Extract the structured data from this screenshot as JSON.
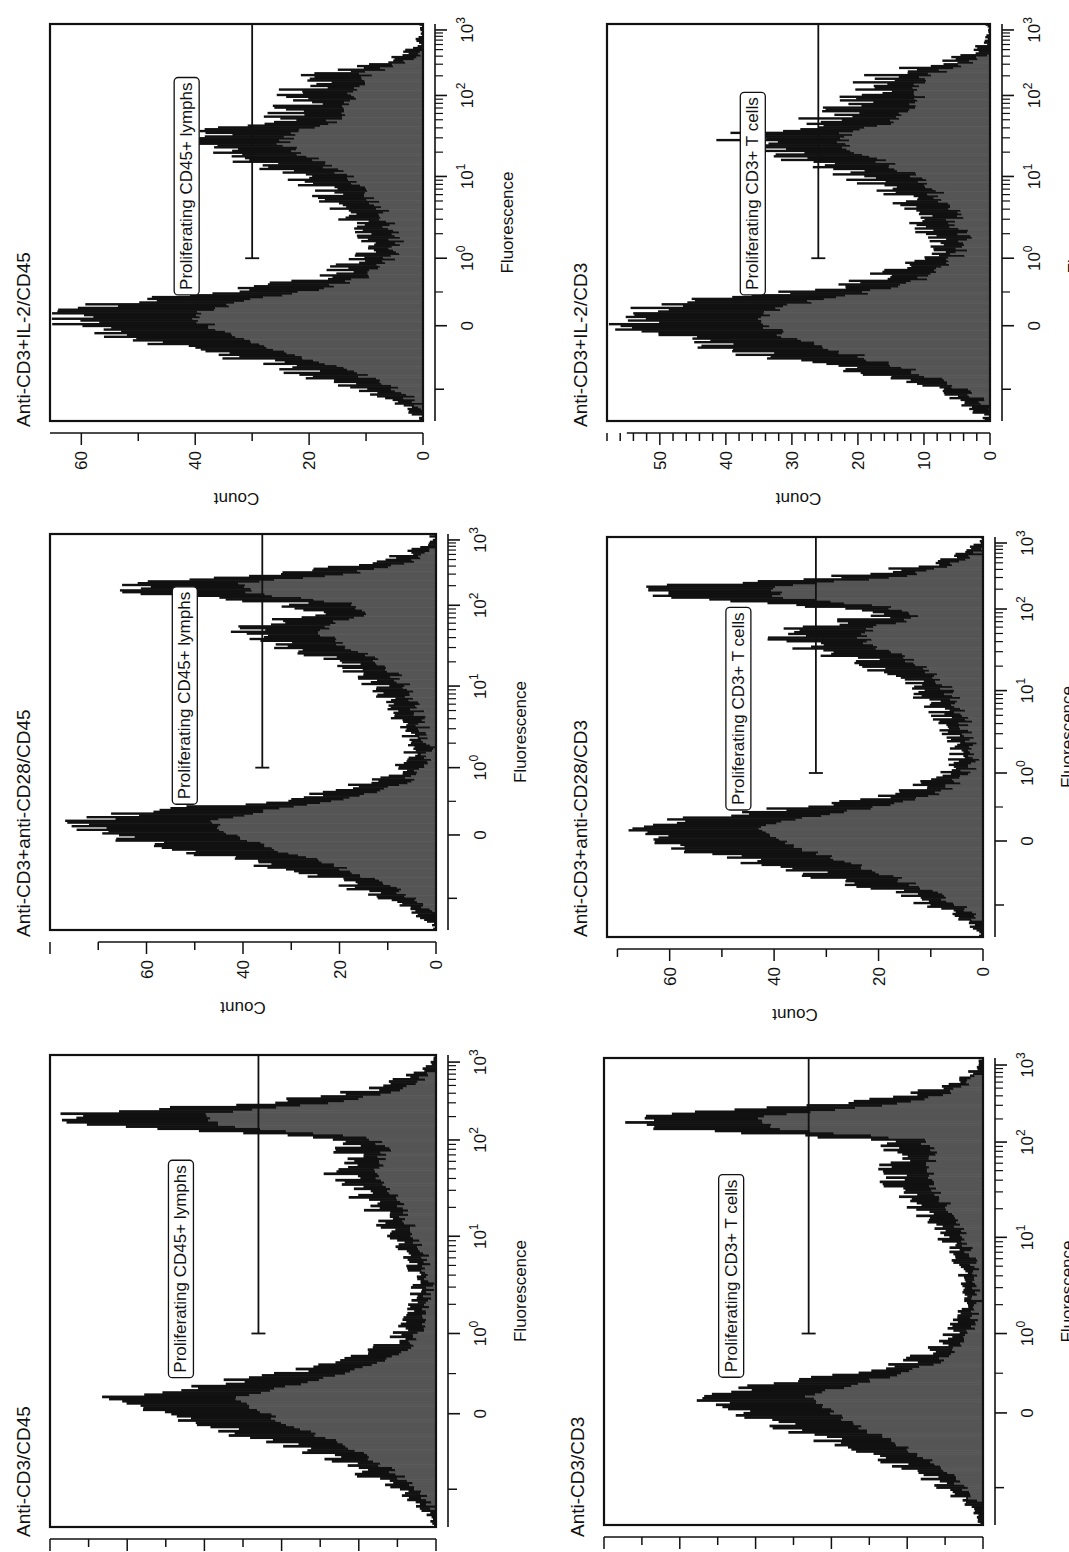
{
  "figure": {
    "orientation": "rotated 90 degrees counter-clockwise",
    "fill_color": "#555555",
    "outline_color": "#111111"
  },
  "chart_data": [
    {
      "id": "p1",
      "type": "bar",
      "title": "Anti-CD3/CD45",
      "xlabel": "Fluorescence",
      "ylabel": "Count",
      "xscale": "biexponential",
      "xticks": [
        "0",
        "10^0",
        "10^1",
        "10^2",
        "10^3"
      ],
      "yticks": [
        "0",
        "20",
        "40",
        "60",
        "80",
        "100"
      ],
      "ylim": [
        0,
        100
      ],
      "gate": {
        "label": "Proliferating CD45+ lymphs",
        "from": "10^0",
        "to": "10^3",
        "count_level": 46
      },
      "profile_x": [
        0,
        0.025,
        0.05,
        0.075,
        0.1,
        0.125,
        0.15,
        0.175,
        0.2,
        0.225,
        0.25,
        0.275,
        0.3,
        0.325,
        0.35,
        0.375,
        0.4,
        0.425,
        0.45,
        0.475,
        0.5,
        0.525,
        0.55,
        0.575,
        0.6,
        0.625,
        0.65,
        0.675,
        0.7,
        0.725,
        0.75,
        0.775,
        0.8,
        0.825,
        0.85,
        0.875,
        0.9,
        0.925,
        0.95,
        0.975,
        1
      ],
      "values": [
        0,
        2,
        5,
        9,
        15,
        22,
        30,
        40,
        52,
        64,
        75,
        82,
        60,
        38,
        24,
        15,
        10,
        8,
        7,
        6,
        5,
        5,
        6,
        7,
        9,
        11,
        14,
        16,
        19,
        23,
        25,
        24,
        22,
        28,
        90,
        95,
        40,
        18,
        8,
        2,
        0
      ]
    },
    {
      "id": "p2",
      "type": "bar",
      "title": "Anti-CD3+anti-CD28/CD45",
      "xlabel": "Fluorescence",
      "ylabel": "Count",
      "xscale": "biexponential",
      "xticks": [
        "0",
        "10^0",
        "10^1",
        "10^2",
        "10^3"
      ],
      "yticks": [
        "0",
        "20",
        "40",
        "60"
      ],
      "ylim": [
        0,
        80
      ],
      "gate": {
        "label": "Proliferating CD45+ lymphs",
        "from": "10^0",
        "to": "10^3",
        "count_level": 36
      },
      "profile_x": [
        0,
        0.025,
        0.05,
        0.075,
        0.1,
        0.125,
        0.15,
        0.175,
        0.2,
        0.225,
        0.25,
        0.275,
        0.3,
        0.325,
        0.35,
        0.375,
        0.4,
        0.425,
        0.45,
        0.475,
        0.5,
        0.525,
        0.55,
        0.575,
        0.6,
        0.625,
        0.65,
        0.675,
        0.7,
        0.725,
        0.75,
        0.775,
        0.8,
        0.825,
        0.85,
        0.875,
        0.9,
        0.925,
        0.95,
        0.975,
        1
      ],
      "values": [
        0,
        2,
        5,
        9,
        15,
        22,
        30,
        40,
        52,
        62,
        70,
        74,
        58,
        35,
        20,
        12,
        8,
        6,
        5,
        5,
        6,
        7,
        8,
        9,
        11,
        13,
        16,
        20,
        26,
        34,
        38,
        36,
        22,
        30,
        62,
        65,
        30,
        12,
        6,
        2,
        0
      ]
    },
    {
      "id": "p3",
      "type": "bar",
      "title": "Anti-CD3+IL-2/CD45",
      "xlabel": "Fluorescence",
      "ylabel": "Count",
      "xscale": "biexponential",
      "xticks": [
        "0",
        "10^0",
        "10^1",
        "10^2",
        "10^3"
      ],
      "yticks": [
        "0",
        "20",
        "40",
        "60"
      ],
      "ylim": [
        0,
        65.5
      ],
      "gate": {
        "label": "Proliferating CD45+ lymphs",
        "from": "10^0",
        "to": "10^3",
        "count_level": 30
      },
      "profile_x": [
        0,
        0.025,
        0.05,
        0.075,
        0.1,
        0.125,
        0.15,
        0.175,
        0.2,
        0.225,
        0.25,
        0.275,
        0.3,
        0.325,
        0.35,
        0.375,
        0.4,
        0.425,
        0.45,
        0.475,
        0.5,
        0.525,
        0.55,
        0.575,
        0.6,
        0.625,
        0.65,
        0.675,
        0.7,
        0.725,
        0.75,
        0.775,
        0.8,
        0.825,
        0.85,
        0.875,
        0.9,
        0.925,
        0.95,
        0.975,
        1
      ],
      "values": [
        0,
        2,
        5,
        9,
        15,
        22,
        30,
        40,
        50,
        57,
        62,
        63,
        52,
        35,
        22,
        15,
        12,
        10,
        9,
        10,
        12,
        13,
        15,
        18,
        21,
        24,
        30,
        36,
        40,
        38,
        28,
        24,
        22,
        22,
        20,
        18,
        8,
        3,
        1,
        0,
        0
      ]
    },
    {
      "id": "p4",
      "type": "bar",
      "title": "Anti-CD3/CD3",
      "xlabel": "Fluorescence",
      "ylabel": "Count",
      "xscale": "biexponential",
      "xticks": [
        "0",
        "10^0",
        "10^1",
        "10^2",
        "10^3"
      ],
      "yticks": [
        "0",
        "20",
        "40",
        "60",
        "80",
        "100"
      ],
      "ylim": [
        0,
        100
      ],
      "gate": {
        "label": "Proliferating CD3+ T cells",
        "from": "10^0",
        "to": "10^3",
        "count_level": 46
      },
      "profile_x": [
        0,
        0.025,
        0.05,
        0.075,
        0.1,
        0.125,
        0.15,
        0.175,
        0.2,
        0.225,
        0.25,
        0.275,
        0.3,
        0.325,
        0.35,
        0.375,
        0.4,
        0.425,
        0.45,
        0.475,
        0.5,
        0.525,
        0.55,
        0.575,
        0.6,
        0.625,
        0.65,
        0.675,
        0.7,
        0.725,
        0.75,
        0.775,
        0.8,
        0.825,
        0.85,
        0.875,
        0.9,
        0.925,
        0.95,
        0.975,
        1
      ],
      "values": [
        0,
        2,
        5,
        9,
        14,
        20,
        28,
        38,
        48,
        58,
        66,
        74,
        56,
        34,
        20,
        13,
        9,
        7,
        6,
        5,
        5,
        5,
        6,
        7,
        9,
        11,
        13,
        16,
        19,
        22,
        24,
        23,
        22,
        28,
        88,
        93,
        38,
        16,
        7,
        2,
        0
      ]
    },
    {
      "id": "p5",
      "type": "bar",
      "title": "Anti-CD3+anti-CD28/CD3",
      "xlabel": "Fluorescence",
      "ylabel": "Count",
      "xscale": "biexponential",
      "xticks": [
        "0",
        "10^0",
        "10^1",
        "10^2",
        "10^3"
      ],
      "yticks": [
        "0",
        "20",
        "40",
        "60"
      ],
      "ylim": [
        0,
        72
      ],
      "gate": {
        "label": "Proliferating CD3+ T cells",
        "from": "10^0",
        "to": "10^3",
        "count_level": 32
      },
      "profile_x": [
        0,
        0.025,
        0.05,
        0.075,
        0.1,
        0.125,
        0.15,
        0.175,
        0.2,
        0.225,
        0.25,
        0.275,
        0.3,
        0.325,
        0.35,
        0.375,
        0.4,
        0.425,
        0.45,
        0.475,
        0.5,
        0.525,
        0.55,
        0.575,
        0.6,
        0.625,
        0.65,
        0.675,
        0.7,
        0.725,
        0.75,
        0.775,
        0.8,
        0.825,
        0.85,
        0.875,
        0.9,
        0.925,
        0.95,
        0.975,
        1
      ],
      "values": [
        0,
        2,
        5,
        9,
        14,
        21,
        29,
        38,
        48,
        58,
        64,
        67,
        54,
        33,
        19,
        12,
        8,
        6,
        5,
        5,
        6,
        7,
        8,
        9,
        11,
        13,
        16,
        20,
        26,
        34,
        38,
        35,
        20,
        30,
        62,
        64,
        28,
        12,
        6,
        2,
        0
      ]
    },
    {
      "id": "p6",
      "type": "bar",
      "title": "Anti-CD3+IL-2/CD3",
      "xlabel": "Fluorescence",
      "ylabel": "Count",
      "xscale": "biexponential",
      "xticks": [
        "0",
        "10^0",
        "10^1",
        "10^2",
        "10^3"
      ],
      "yticks": [
        "0",
        "10",
        "20",
        "30",
        "40",
        "50"
      ],
      "ylim": [
        0,
        58
      ],
      "gate": {
        "label": "Proliferating CD3+ T cells",
        "from": "10^0",
        "to": "10^3",
        "count_level": 26
      },
      "profile_x": [
        0,
        0.025,
        0.05,
        0.075,
        0.1,
        0.125,
        0.15,
        0.175,
        0.2,
        0.225,
        0.25,
        0.275,
        0.3,
        0.325,
        0.35,
        0.375,
        0.4,
        0.425,
        0.45,
        0.475,
        0.5,
        0.525,
        0.55,
        0.575,
        0.6,
        0.625,
        0.65,
        0.675,
        0.7,
        0.725,
        0.75,
        0.775,
        0.8,
        0.825,
        0.85,
        0.875,
        0.9,
        0.925,
        0.95,
        0.975,
        1
      ],
      "values": [
        0,
        2,
        4,
        8,
        13,
        20,
        28,
        37,
        46,
        52,
        55,
        54,
        45,
        30,
        20,
        14,
        11,
        9,
        8,
        9,
        10,
        11,
        13,
        15,
        18,
        21,
        27,
        33,
        37,
        36,
        26,
        22,
        20,
        19,
        18,
        16,
        7,
        3,
        1,
        0,
        0
      ]
    }
  ]
}
